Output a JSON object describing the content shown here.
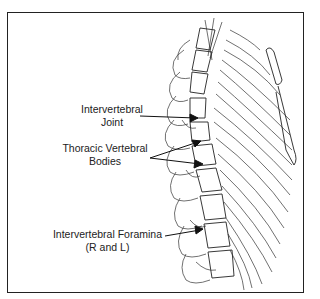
{
  "figure": {
    "labels": [
      {
        "id": "joint",
        "lines": [
          "Intervertebral",
          "Joint"
        ]
      },
      {
        "id": "bodies",
        "lines": [
          "Thoracic Vertebral",
          "Bodies"
        ]
      },
      {
        "id": "foramina",
        "lines": [
          "Intervertebral Foramina",
          "(R and L)"
        ]
      }
    ]
  },
  "colors": {
    "line": "#222222",
    "background": "#ffffff"
  }
}
